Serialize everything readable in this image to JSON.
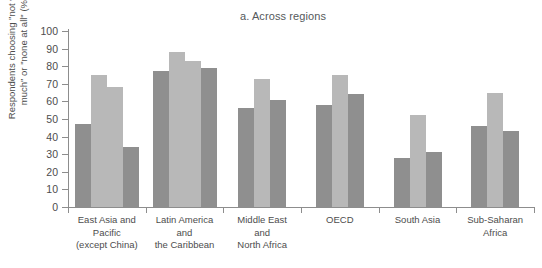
{
  "chart_data": {
    "type": "bar",
    "title": "a. Across regions",
    "xlabel": "",
    "ylabel": "Respondents choosing \"not very\nmuch\" or \"none at all\" (%)",
    "ylim": [
      0,
      100
    ],
    "ytick_labels": [
      "0",
      "10",
      "20",
      "30",
      "40",
      "50",
      "60",
      "70",
      "80",
      "90",
      "100"
    ],
    "ytick_values": [
      0,
      10,
      20,
      30,
      40,
      50,
      60,
      70,
      80,
      90,
      100
    ],
    "grid": false,
    "legend": "none",
    "categories": [
      "East Asia and\nPacific\n(except China)",
      "Latin America\nand\nthe Caribbean",
      "Middle East\nand\nNorth Africa",
      "OECD",
      "South Asia",
      "Sub-Saharan\nAfrica"
    ],
    "groups": [
      {
        "category": "East Asia and\nPacific\n(except China)",
        "bars": [
          {
            "value": 47,
            "color": "#8f8f8f"
          },
          {
            "value": 75,
            "color": "#b8b8b8"
          },
          {
            "value": 68,
            "color": "#b8b8b8"
          },
          {
            "value": 34,
            "color": "#8f8f8f"
          }
        ]
      },
      {
        "category": "Latin America\nand\nthe Caribbean",
        "bars": [
          {
            "value": 77,
            "color": "#8f8f8f"
          },
          {
            "value": 88,
            "color": "#b8b8b8"
          },
          {
            "value": 83,
            "color": "#b8b8b8"
          },
          {
            "value": 79,
            "color": "#8f8f8f"
          }
        ]
      },
      {
        "category": "Middle East\nand\nNorth Africa",
        "bars": [
          {
            "value": 56,
            "color": "#8f8f8f"
          },
          {
            "value": 73,
            "color": "#b8b8b8"
          },
          {
            "value": 61,
            "color": "#8f8f8f"
          }
        ]
      },
      {
        "category": "OECD",
        "bars": [
          {
            "value": 58,
            "color": "#8f8f8f"
          },
          {
            "value": 75,
            "color": "#b8b8b8"
          },
          {
            "value": 64,
            "color": "#8f8f8f"
          }
        ]
      },
      {
        "category": "South Asia",
        "bars": [
          {
            "value": 28,
            "color": "#8f8f8f"
          },
          {
            "value": 52,
            "color": "#b8b8b8"
          },
          {
            "value": 31,
            "color": "#8f8f8f"
          }
        ]
      },
      {
        "category": "Sub-Saharan\nAfrica",
        "bars": [
          {
            "value": 46,
            "color": "#8f8f8f"
          },
          {
            "value": 65,
            "color": "#b8b8b8"
          },
          {
            "value": 43,
            "color": "#8f8f8f"
          }
        ]
      }
    ],
    "colors": {
      "dark_gray": "#8f8f8f",
      "light_gray": "#b8b8b8",
      "axis": "#8d8d8d",
      "text": "#4d4d4d"
    }
  }
}
